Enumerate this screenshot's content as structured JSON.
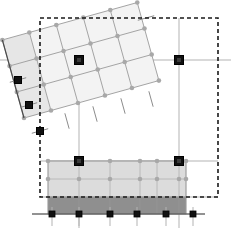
{
  "diagram": {
    "title": "Mesh Transform Overlay",
    "canvas": {
      "width": 231,
      "height": 239,
      "background": "#ffffff"
    },
    "colors": {
      "background": "#ffffff",
      "bounding_box_stroke": "#1a1a1a",
      "axis_line": "#b3b3b3",
      "tick_line": "#8c8c8c",
      "mesh_stroke": "#9a9a9a",
      "mesh_fill_light": "#f2f2f2",
      "mesh_fill_medium": "#e8e8e8",
      "node_dot": "#a8a8a8",
      "handle_fill": "#111111",
      "handle_stroke": "#000000",
      "band_upper_fill": "#dcdcdc",
      "band_lower_fill": "#8f8f8f",
      "band_stroke": "#9a9a9a",
      "baseline_stroke": "#4d4d4d"
    },
    "bounding_box": {
      "label": "selection-bounds",
      "x": 40,
      "y": 18,
      "width": 178,
      "height": 179,
      "stroke_dasharray": "4 3",
      "stroke_width": 1.6
    },
    "axes": {
      "horizontal": [
        {
          "name": "axis-h-upper",
          "y": 60,
          "x1": 0,
          "x2": 231
        },
        {
          "name": "axis-h-mid",
          "y": 161,
          "x1": 40,
          "x2": 218
        },
        {
          "name": "axis-h-lower",
          "y": 197,
          "x1": 40,
          "x2": 218
        },
        {
          "name": "axis-h-baseline",
          "y": 214,
          "x1": 32,
          "x2": 205
        }
      ],
      "vertical": [
        {
          "name": "axis-v-1",
          "x": 79,
          "y1": 18,
          "y2": 228
        },
        {
          "name": "axis-v-2",
          "x": 179,
          "y1": 18,
          "y2": 228
        }
      ]
    },
    "rotated_mesh": {
      "label": "rotated-grid-patch",
      "rotation_degrees": -15.5,
      "origin_x": 24,
      "origin_y": 118,
      "cell_width": 28,
      "cell_height": 27,
      "columns": 5,
      "rows": 3,
      "fill": "#f3f3f3",
      "first_column_fill": "#e6e6e6"
    },
    "bands": [
      {
        "name": "band-upper",
        "x": 48,
        "y": 161,
        "width": 138,
        "height": 36,
        "fill": "#dcdcdc",
        "opacity": 1
      },
      {
        "name": "band-lower",
        "x": 48,
        "y": 197,
        "width": 138,
        "height": 17,
        "fill": "#8f8f8f",
        "opacity": 1
      }
    ],
    "band_grid": {
      "vertical_x": [
        48,
        79,
        110,
        140,
        157,
        179,
        186
      ],
      "horizontal_y": [
        161,
        179,
        197
      ]
    },
    "handles": [
      {
        "name": "handle-mesh-top-left",
        "x": 79,
        "y": 60,
        "size": 9
      },
      {
        "name": "handle-mesh-top-right",
        "x": 179,
        "y": 60,
        "size": 9
      },
      {
        "name": "handle-band-top-left",
        "x": 79,
        "y": 161,
        "size": 9
      },
      {
        "name": "handle-band-top-right",
        "x": 179,
        "y": 161,
        "size": 9
      },
      {
        "name": "handle-edge-upper",
        "x": 18,
        "y": 80,
        "size": 7
      },
      {
        "name": "handle-edge-middle",
        "x": 29,
        "y": 105,
        "size": 7
      },
      {
        "name": "handle-edge-lower",
        "x": 40,
        "y": 131,
        "size": 7
      }
    ],
    "baseline_handles": [
      {
        "name": "baseline-handle-1",
        "x": 52,
        "y": 214,
        "size": 6
      },
      {
        "name": "baseline-handle-2",
        "x": 79,
        "y": 214,
        "size": 6
      },
      {
        "name": "baseline-handle-3",
        "x": 110,
        "y": 214,
        "size": 6
      },
      {
        "name": "baseline-handle-4",
        "x": 137,
        "y": 214,
        "size": 6
      },
      {
        "name": "baseline-handle-5",
        "x": 166,
        "y": 214,
        "size": 6
      },
      {
        "name": "baseline-handle-6",
        "x": 193,
        "y": 214,
        "size": 6
      }
    ],
    "band_nodes": [
      {
        "x": 48,
        "y": 161
      },
      {
        "x": 110,
        "y": 161
      },
      {
        "x": 140,
        "y": 161
      },
      {
        "x": 157,
        "y": 161
      },
      {
        "x": 186,
        "y": 161
      },
      {
        "x": 48,
        "y": 179
      },
      {
        "x": 79,
        "y": 179
      },
      {
        "x": 110,
        "y": 179
      },
      {
        "x": 140,
        "y": 179
      },
      {
        "x": 157,
        "y": 179
      },
      {
        "x": 179,
        "y": 179
      },
      {
        "x": 186,
        "y": 179
      }
    ],
    "tick_marks": [
      {
        "name": "tick-ul-1",
        "cx": 18,
        "cy": 80,
        "angle": -15.5,
        "length": 17
      },
      {
        "name": "tick-ul-2",
        "cx": 29,
        "cy": 105,
        "angle": -15.5,
        "length": 17
      },
      {
        "name": "tick-ul-3",
        "cx": 40,
        "cy": 131,
        "angle": -15.5,
        "length": 17
      },
      {
        "name": "tick-ur-1",
        "cx": 146,
        "cy": 18,
        "angle": -15.5,
        "length": 17
      },
      {
        "name": "tick-m-1",
        "cx": 67,
        "cy": 121,
        "angle": 74.5,
        "length": 16
      },
      {
        "name": "tick-m-2",
        "cx": 95,
        "cy": 114,
        "angle": 74.5,
        "length": 16
      },
      {
        "name": "tick-m-3",
        "cx": 123,
        "cy": 106,
        "angle": 74.5,
        "length": 16
      },
      {
        "name": "tick-m-4",
        "cx": 151,
        "cy": 99,
        "angle": 74.5,
        "length": 16
      }
    ],
    "legend_note": ""
  }
}
